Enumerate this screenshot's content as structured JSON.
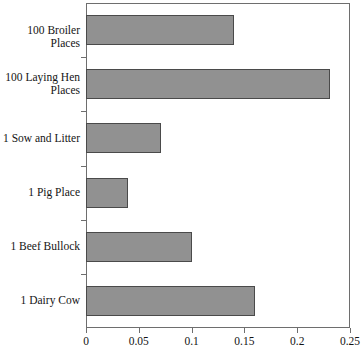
{
  "chart_data": {
    "type": "bar",
    "orientation": "horizontal",
    "title": "",
    "subtitle": "",
    "xlabel": "",
    "ylabel": "",
    "xlim": [
      0,
      0.25
    ],
    "xticks": [
      "0",
      "0.05",
      "0.1",
      "0.15",
      "0.2",
      "0.25"
    ],
    "xtick_values": [
      0,
      0.05,
      0.1,
      0.15,
      0.2,
      0.25
    ],
    "grid": false,
    "legend": "none",
    "bar_color": "#919191",
    "bar_edge_color": "#4a4a4a",
    "axis_color": "#6e6e6e",
    "background": "#ffffff",
    "categories": [
      "100 Broiler Places",
      "100 Laying Hen\nPlaces",
      "1 Sow and Litter",
      "1 Pig Place",
      "1 Beef Bullock",
      "1 Dairy Cow"
    ],
    "values": [
      0.14,
      0.231,
      0.071,
      0.04,
      0.1,
      0.16
    ]
  }
}
